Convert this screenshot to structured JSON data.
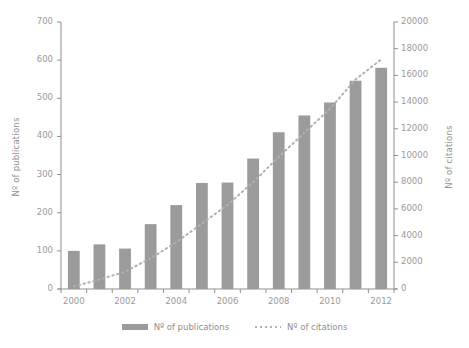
{
  "chart_data": {
    "type": "bar",
    "title": "",
    "xlabel": "",
    "ylabel": "Nº of publications",
    "y2label": "Nº of citations",
    "categories": [
      2000,
      2001,
      2002,
      2003,
      2004,
      2005,
      2006,
      2007,
      2008,
      2009,
      2010,
      2011,
      2012
    ],
    "x_tick_labels": [
      "2000",
      "2002",
      "2004",
      "2006",
      "2008",
      "2010",
      "2012"
    ],
    "y_tick_labels": [
      "0",
      "100",
      "200",
      "300",
      "400",
      "500",
      "600",
      "700"
    ],
    "y2_tick_labels": [
      "0",
      "2000",
      "4000",
      "6000",
      "8000",
      "10000",
      "12000",
      "14000",
      "16000",
      "18000",
      "20000"
    ],
    "ylim": [
      0,
      700
    ],
    "y2lim": [
      0,
      20000
    ],
    "grid": false,
    "legend_position": "bottom",
    "series": [
      {
        "name": "Nº of publications",
        "kind": "bar",
        "axis": "left",
        "color": "#9b9b9b",
        "values": [
          100,
          117,
          106,
          170,
          220,
          278,
          279,
          342,
          411,
          455,
          489,
          546,
          580
        ]
      },
      {
        "name": "Nº of citations",
        "kind": "dotted-line",
        "axis": "right",
        "color": "#b0b0b0",
        "values": [
          200,
          700,
          1300,
          2300,
          3500,
          4900,
          6300,
          8000,
          9900,
          11700,
          13500,
          15700,
          17200
        ]
      }
    ]
  },
  "legend": {
    "items": [
      {
        "label": "Nº of publications",
        "marker": "bar-swatch"
      },
      {
        "label": "Nº of citations",
        "marker": "dotted-swatch"
      }
    ]
  }
}
